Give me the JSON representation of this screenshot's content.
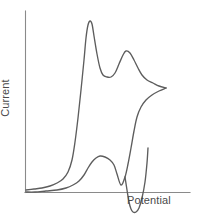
{
  "figure": {
    "background_color": "#ffffff",
    "axis_color": "#8a8a8a",
    "trace_color": "#5d5d5d"
  },
  "chart_data": {
    "type": "line",
    "title": "",
    "subtitle": "",
    "xlabel": "Potential",
    "ylabel": "Current",
    "grid": false,
    "legend": null,
    "legend_position": "none",
    "axis_ticks": "none",
    "axes": {
      "x_origin_px": 25,
      "y_origin_px": 192,
      "x_axis_end_px": 190,
      "y_axis_top_px": 11,
      "xlim_label": [
        "0",
        "max"
      ],
      "ylim_label": [
        "0",
        "max"
      ]
    },
    "annotations": [
      {
        "name": "anodic-peak-1",
        "label": "first oxidation peak",
        "x_px": 90,
        "y_px": 21
      },
      {
        "name": "anodic-valley",
        "label": "valley between oxidation peaks",
        "x_px": 107,
        "y_px": 77
      },
      {
        "name": "anodic-peak-2",
        "label": "second oxidation peak",
        "x_px": 126,
        "y_px": 51
      },
      {
        "name": "switching-potential",
        "label": "scan reversal vertex",
        "x_px": 166,
        "y_px": 88
      },
      {
        "name": "return-shoulder",
        "label": "reverse scan shoulder",
        "x_px": 96,
        "y_px": 158
      },
      {
        "name": "cathodic-peak",
        "label": "reduction peak below baseline",
        "x_px": 122,
        "y_px": 212
      }
    ],
    "series": [
      {
        "name": "forward-scan",
        "direction": "anodic",
        "points_px": [
          [
            26,
            190
          ],
          [
            34,
            189
          ],
          [
            42,
            188
          ],
          [
            50,
            186
          ],
          [
            57,
            183
          ],
          [
            63,
            179
          ],
          [
            68,
            172
          ],
          [
            72,
            160
          ],
          [
            75,
            142
          ],
          [
            78,
            118
          ],
          [
            81,
            90
          ],
          [
            84,
            60
          ],
          [
            86,
            38
          ],
          [
            88,
            25
          ],
          [
            90,
            21
          ],
          [
            92,
            24
          ],
          [
            94,
            36
          ],
          [
            97,
            54
          ],
          [
            100,
            68
          ],
          [
            103,
            75
          ],
          [
            107,
            77
          ],
          [
            111,
            77
          ],
          [
            115,
            73
          ],
          [
            119,
            64
          ],
          [
            123,
            55
          ],
          [
            126,
            51
          ],
          [
            130,
            53
          ],
          [
            134,
            60
          ],
          [
            138,
            68
          ],
          [
            142,
            75
          ],
          [
            147,
            80
          ],
          [
            153,
            83
          ],
          [
            159,
            86
          ],
          [
            166,
            88
          ]
        ]
      },
      {
        "name": "reverse-scan",
        "direction": "cathodic",
        "points_px": [
          [
            166,
            88
          ],
          [
            159,
            91
          ],
          [
            152,
            95
          ],
          [
            146,
            100
          ],
          [
            141,
            107
          ],
          [
            137,
            117
          ],
          [
            134,
            131
          ],
          [
            131,
            148
          ],
          [
            128,
            164
          ],
          [
            125,
            177
          ],
          [
            121,
            185
          ],
          [
            117,
            174
          ],
          [
            114,
            165
          ],
          [
            110,
            160
          ],
          [
            105,
            157
          ],
          [
            100,
            156
          ],
          [
            96,
            158
          ],
          [
            92,
            162
          ],
          [
            88,
            168
          ],
          [
            84,
            175
          ],
          [
            79,
            181
          ],
          [
            73,
            185
          ],
          [
            66,
            188
          ],
          [
            57,
            190
          ],
          [
            46,
            191
          ],
          [
            35,
            192
          ],
          [
            26,
            192
          ]
        ]
      },
      {
        "name": "cathodic-dip",
        "direction": "cathodic",
        "points_px": [
          [
            125,
            177
          ],
          [
            127,
            190
          ],
          [
            129,
            202
          ],
          [
            131,
            209
          ],
          [
            133,
            212
          ],
          [
            136,
            212
          ],
          [
            139,
            208
          ],
          [
            142,
            198
          ],
          [
            145,
            182
          ],
          [
            147,
            163
          ],
          [
            148,
            148
          ]
        ]
      }
    ]
  },
  "labels": {
    "x_axis": "Potential",
    "y_axis": "Current"
  }
}
